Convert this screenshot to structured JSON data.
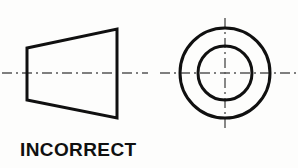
{
  "figure": {
    "caption": "INCORRECT",
    "background_color": "#fdfdfc",
    "line_color": "#101010",
    "centerline_color": "#555555",
    "object_line_width": 3,
    "centerline_width": 1.4
  },
  "views": {
    "front_view": {
      "name": "front-view-trapezoid",
      "shape": "trapezoid",
      "description": "Front view of truncated cone drawn as a trapezoid",
      "left_edge_x": 27,
      "right_edge_x": 117,
      "left_top_y": 48,
      "left_bottom_y": 100,
      "right_top_y": 29,
      "right_bottom_y": 118
    },
    "side_view": {
      "name": "side-view-circles",
      "shape": "concentric-circles",
      "description": "Side view of truncated cone drawn as two concentric circles",
      "center_x": 225,
      "center_y": 73,
      "outer_radius": 45,
      "inner_radius": 27
    }
  },
  "centerlines": {
    "front_horizontal": {
      "name": "front-view-horizontal-centerline",
      "x1": 2,
      "x2": 148,
      "y": 73
    },
    "side_horizontal": {
      "name": "side-view-horizontal-centerline",
      "x1": 160,
      "x2": 296,
      "y": 73
    },
    "side_vertical": {
      "name": "side-view-vertical-centerline",
      "x": 225,
      "y1": 18,
      "y2": 128
    },
    "dash_pattern": "10 4 2 4"
  }
}
